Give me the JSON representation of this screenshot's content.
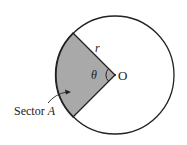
{
  "diagram": {
    "labels": {
      "center": "O",
      "radius": "r",
      "angle": "θ",
      "sector": "Sector A"
    },
    "colors": {
      "sector_fill": "#a9a9a9",
      "stroke": "#222222",
      "background": "#ffffff"
    },
    "geometry": {
      "center": [
        115,
        75
      ],
      "radius": 59
    }
  }
}
